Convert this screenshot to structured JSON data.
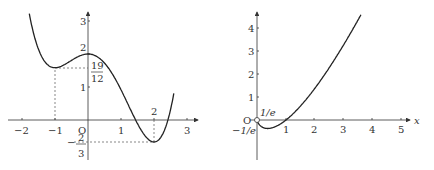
{
  "chart_data": [
    {
      "type": "line",
      "title": "",
      "function": "f(x) = x^4/4 - x^3/3 - x^2 + 2",
      "xlabel": "",
      "ylabel": "",
      "xlim": [
        -2.5,
        3.2
      ],
      "ylim": [
        -1.1,
        3.3
      ],
      "x_ticks": [
        "-2",
        "-1",
        "O",
        "1",
        "3"
      ],
      "y_ticks": [
        "1",
        "2",
        "3"
      ],
      "annotations": {
        "local_max": {
          "x": 0,
          "y": 2,
          "label": "2"
        },
        "local_min_left": {
          "x": -1,
          "y": "19/12",
          "label_num": "19",
          "label_den": "12"
        },
        "global_min": {
          "x": 2,
          "y": "-2/3",
          "x_label": "2",
          "label_sign": "−",
          "label_num": "2",
          "label_den": "3"
        }
      },
      "grid": false,
      "dashed_guides": true
    },
    {
      "type": "line",
      "title": "",
      "function": "g(x) = x ln x",
      "xlabel": "x",
      "ylabel": "",
      "xlim": [
        0,
        5.3
      ],
      "ylim": [
        -1.2,
        4.8
      ],
      "x_ticks": [
        "1",
        "2",
        "3",
        "4",
        "5"
      ],
      "y_ticks": [
        "1",
        "2",
        "3",
        "4"
      ],
      "origin_label": "O",
      "annotations": {
        "min_point_x": "1/e",
        "min_value": "−1/e",
        "open_circle_at_origin": true
      },
      "grid": false
    }
  ],
  "left": {
    "xticks": [
      "−2",
      "−1",
      "1",
      "3"
    ],
    "origin": "O",
    "yticks": [
      "1",
      "2",
      "3"
    ],
    "max_label": "2",
    "frac19": "19",
    "frac12": "12",
    "x2_label": "2",
    "neg_sign": "−",
    "frac2": "2",
    "frac3": "3"
  },
  "right": {
    "xticks": [
      "1",
      "2",
      "3",
      "4",
      "5"
    ],
    "yticks": [
      "1",
      "2",
      "3",
      "4"
    ],
    "origin": "O",
    "x_axis_label": "x",
    "min_x_label": "1/e",
    "min_y_label": "−1/e"
  }
}
